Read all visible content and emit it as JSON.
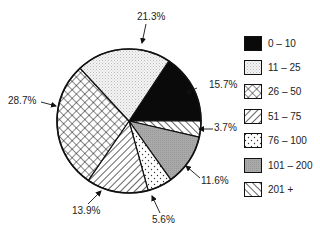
{
  "chart_data": {
    "type": "pie",
    "title": "",
    "start_angle_deg": -56.5,
    "direction": "clockwise",
    "slices": [
      {
        "category": "0 – 10",
        "value": 15.7,
        "label": "15.7%",
        "pattern": "solid-black"
      },
      {
        "category": "201 +",
        "value": 3.7,
        "label": "3.7%",
        "pattern": "diag-back"
      },
      {
        "category": "101 – 200",
        "value": 11.6,
        "label": "11.6%",
        "pattern": "gray"
      },
      {
        "category": "76 – 100",
        "value": 5.6,
        "label": "5.6%",
        "pattern": "dots"
      },
      {
        "category": "51 – 75",
        "value": 13.9,
        "label": "13.9%",
        "pattern": "diag-fwd"
      },
      {
        "category": "26 – 50",
        "value": 28.7,
        "label": "28.7%",
        "pattern": "crosshatch"
      },
      {
        "category": "11 – 25",
        "value": 21.3,
        "label": "21.3%",
        "pattern": "stipple"
      }
    ],
    "legend": [
      "0 – 10",
      "11 – 25",
      "26 – 50",
      "51 – 75",
      "76 – 100",
      "101 – 200",
      "201 +"
    ],
    "legend_position": "right"
  },
  "legend_items": [
    {
      "label": "0 – 10",
      "pattern": "solid-black"
    },
    {
      "label": "11 – 25",
      "pattern": "stipple"
    },
    {
      "label": "26 – 50",
      "pattern": "crosshatch"
    },
    {
      "label": "51 – 75",
      "pattern": "diag-fwd"
    },
    {
      "label": "76 – 100",
      "pattern": "dots"
    },
    {
      "label": "101 – 200",
      "pattern": "gray"
    },
    {
      "label": "201 +",
      "pattern": "diag-back"
    }
  ],
  "labels": [
    {
      "text": "15.7%",
      "x": 209,
      "y": 88,
      "anchor": "start",
      "ax": 197,
      "ay": 88,
      "tx": 186,
      "ty": 93
    },
    {
      "text": "3.7%",
      "x": 214,
      "y": 131,
      "anchor": "start",
      "ax": 213,
      "ay": 129,
      "tx": 199,
      "ty": 129
    },
    {
      "text": "11.6%",
      "x": 201,
      "y": 184,
      "anchor": "start",
      "ax": 200,
      "ay": 178,
      "tx": 186,
      "ty": 166
    },
    {
      "text": "5.6%",
      "x": 152,
      "y": 223,
      "anchor": "start",
      "ax": 160,
      "ay": 213,
      "tx": 152,
      "ty": 196
    },
    {
      "text": "13.9%",
      "x": 72,
      "y": 214,
      "anchor": "start",
      "ax": 88,
      "ay": 204,
      "tx": 101,
      "ty": 191
    },
    {
      "text": "28.7%",
      "x": 8,
      "y": 104,
      "anchor": "start",
      "ax": 41,
      "ay": 102,
      "tx": 56,
      "ty": 106
    },
    {
      "text": "21.3%",
      "x": 137,
      "y": 20,
      "anchor": "start",
      "ax": 146,
      "ay": 24,
      "tx": 142,
      "ty": 43
    }
  ]
}
